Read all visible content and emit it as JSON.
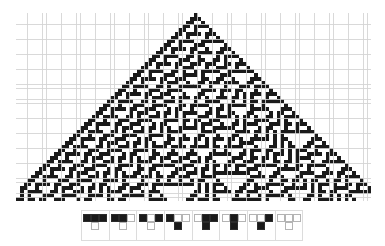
{
  "figure": {
    "name": "elementary-cellular-automaton-rule-30",
    "rule_number": 30,
    "rule_binary": "00011110",
    "colors": {
      "cell_on": "#1a1a1a",
      "cell_off": "#ffffff",
      "grid_line": "#d2d2d2",
      "icon_border": "#dcdcdc",
      "background": "#ffffff"
    }
  },
  "evolution": {
    "name": "spacetime-diagram",
    "columns": 94,
    "rows": 50,
    "cell_size_px": 3.776,
    "initial_condition": "single-black-cell-center",
    "initial_center_column": 47,
    "grid_visible": true,
    "left_px": 16,
    "top_px": 13,
    "width_px": 355,
    "height_px": 188
  },
  "rule_icons": {
    "name": "rule-transition-icons",
    "count": 8,
    "items": [
      {
        "id": "rule-case-7",
        "neighborhood": [
          1,
          1,
          1
        ],
        "output": 0,
        "label": "111 -> 0"
      },
      {
        "id": "rule-case-6",
        "neighborhood": [
          1,
          1,
          0
        ],
        "output": 0,
        "label": "110 -> 0"
      },
      {
        "id": "rule-case-5",
        "neighborhood": [
          1,
          0,
          1
        ],
        "output": 0,
        "label": "101 -> 0"
      },
      {
        "id": "rule-case-4",
        "neighborhood": [
          1,
          0,
          0
        ],
        "output": 1,
        "label": "100 -> 1"
      },
      {
        "id": "rule-case-3",
        "neighborhood": [
          0,
          1,
          1
        ],
        "output": 1,
        "label": "011 -> 1"
      },
      {
        "id": "rule-case-2",
        "neighborhood": [
          0,
          1,
          0
        ],
        "output": 1,
        "label": "010 -> 1"
      },
      {
        "id": "rule-case-1",
        "neighborhood": [
          0,
          0,
          1
        ],
        "output": 1,
        "label": "001 -> 1"
      },
      {
        "id": "rule-case-0",
        "neighborhood": [
          0,
          0,
          0
        ],
        "output": 0,
        "label": "000 -> 0"
      }
    ]
  }
}
